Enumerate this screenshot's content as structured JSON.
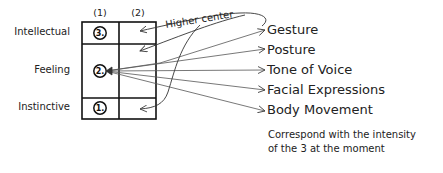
{
  "diagram": {
    "column_headers": [
      "(1)",
      "(2)"
    ],
    "rows": [
      {
        "label": "Intellectual",
        "number": "3."
      },
      {
        "label": "Feeling",
        "number": "2."
      },
      {
        "label": "Instinctive",
        "number": "1."
      }
    ],
    "higher_center_label": "Higher center",
    "outputs": [
      "Gesture",
      "Posture",
      "Tone of Voice",
      "Facial Expressions",
      "Body Movement"
    ],
    "note_lines": [
      "Correspond with the intensity",
      "of the 3 at the moment"
    ],
    "colors": {
      "ink": "#222222",
      "line": "#555555",
      "background": "#ffffff"
    }
  }
}
